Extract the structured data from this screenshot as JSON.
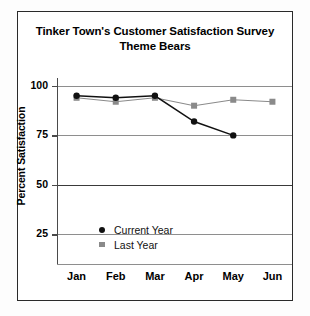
{
  "chart_data": {
    "type": "line",
    "title": "Tinker Town's Customer Satisfaction Survey",
    "subtitle": "Theme Bears",
    "xlabel": "",
    "ylabel": "Percent Satisfaction",
    "categories": [
      "Jan",
      "Feb",
      "Mar",
      "Apr",
      "May",
      "Jun"
    ],
    "series": [
      {
        "name": "Current Year",
        "marker": "circle",
        "color": "#111111",
        "values": [
          95,
          94,
          95,
          82,
          75,
          null
        ]
      },
      {
        "name": "Last Year",
        "marker": "square",
        "color": "#8a8a8a",
        "values": [
          94,
          92,
          94,
          90,
          93,
          92
        ]
      }
    ],
    "yticks": [
      25,
      50,
      75,
      100
    ],
    "ylim": [
      10,
      104
    ],
    "grid": true,
    "legend_position": "inside-bottom-center"
  },
  "legend": {
    "items": [
      {
        "label": "Current Year"
      },
      {
        "label": "Last Year"
      }
    ]
  },
  "axis": {
    "y_labels": [
      "100",
      "75",
      "50",
      "25"
    ],
    "x_labels": [
      "Jan",
      "Feb",
      "Mar",
      "Apr",
      "May",
      "Jun"
    ],
    "y_title": "Percent Satisfaction"
  }
}
